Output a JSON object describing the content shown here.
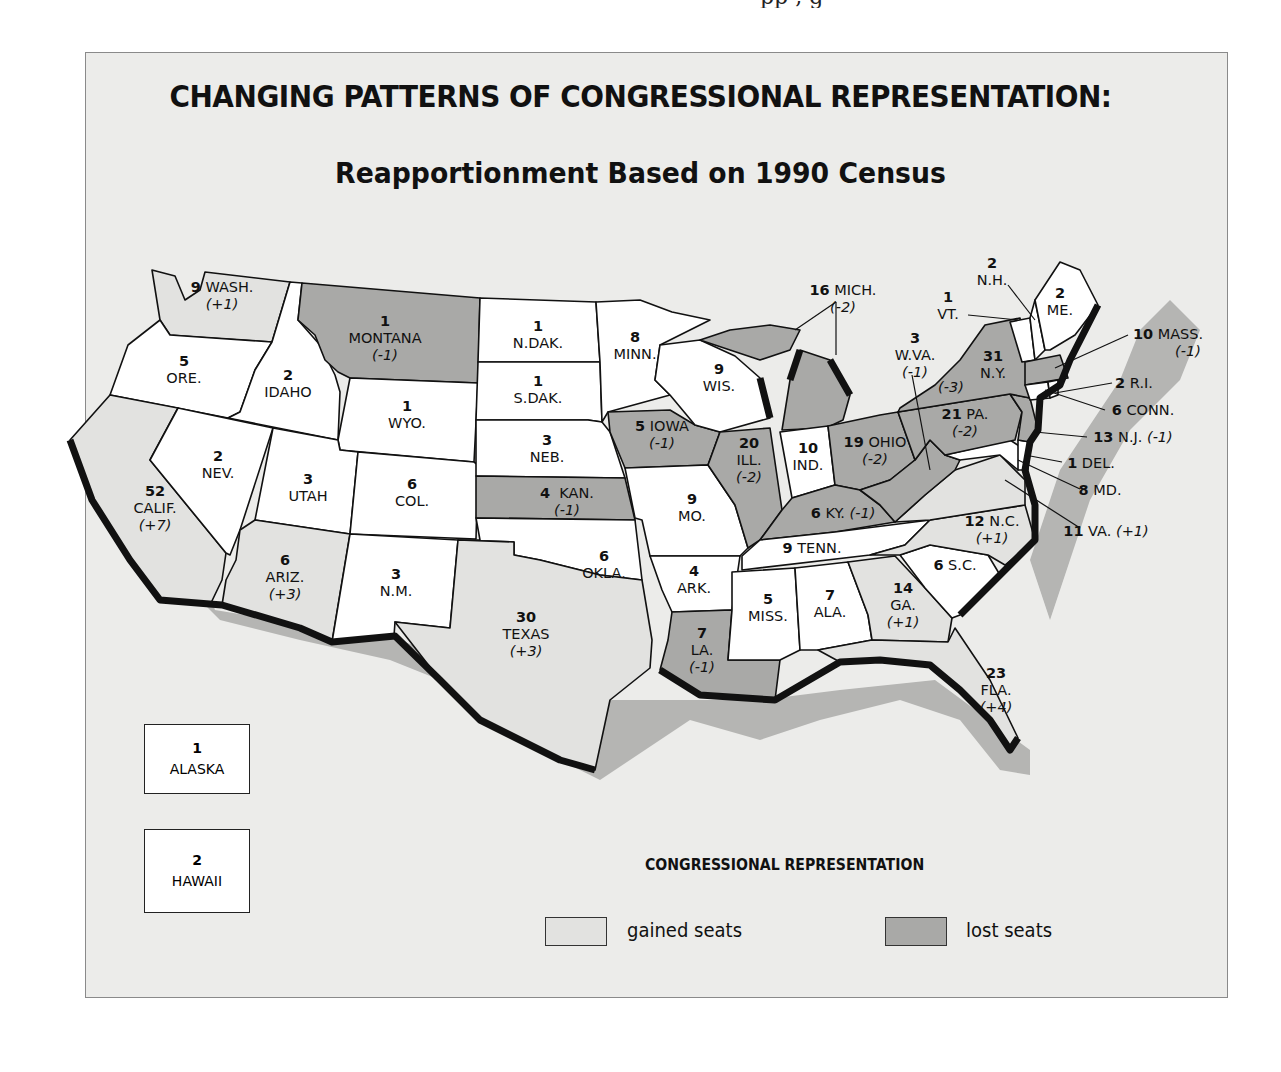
{
  "map": {
    "title": "CHANGING PATTERNS OF CONGRESSIONAL  REPRESENTATION:",
    "subtitle": "Reapportionment Based on 1990 Census",
    "colors": {
      "background": "#ececea",
      "unchanged": "#ffffff",
      "gained": "#e2e2e0",
      "lost": "#a9a9a7",
      "shadow": "#b5b5b3",
      "coast": "#111111"
    },
    "states": [
      {
        "abbr": "WASH.",
        "seats": "9",
        "change": "(+1)",
        "status": "gained"
      },
      {
        "abbr": "ORE.",
        "seats": "5",
        "change": "",
        "status": "unchanged"
      },
      {
        "abbr": "CALIF.",
        "seats": "52",
        "change": "(+7)",
        "status": "gained"
      },
      {
        "abbr": "IDAHO",
        "seats": "2",
        "change": "",
        "status": "unchanged"
      },
      {
        "abbr": "NEV.",
        "seats": "2",
        "change": "",
        "status": "unchanged"
      },
      {
        "abbr": "MONTANA",
        "seats": "1",
        "change": "(-1)",
        "status": "lost"
      },
      {
        "abbr": "WYO.",
        "seats": "1",
        "change": "",
        "status": "unchanged"
      },
      {
        "abbr": "UTAH",
        "seats": "3",
        "change": "",
        "status": "unchanged"
      },
      {
        "abbr": "ARIZ.",
        "seats": "6",
        "change": "(+3)",
        "status": "gained"
      },
      {
        "abbr": "COL.",
        "seats": "6",
        "change": "",
        "status": "unchanged"
      },
      {
        "abbr": "N.M.",
        "seats": "3",
        "change": "",
        "status": "unchanged"
      },
      {
        "abbr": "N.DAK.",
        "seats": "1",
        "change": "",
        "status": "unchanged"
      },
      {
        "abbr": "S.DAK.",
        "seats": "1",
        "change": "",
        "status": "unchanged"
      },
      {
        "abbr": "NEB.",
        "seats": "3",
        "change": "",
        "status": "unchanged"
      },
      {
        "abbr": "KAN.",
        "seats": "4",
        "change": "(-1)",
        "status": "lost"
      },
      {
        "abbr": "OKLA.",
        "seats": "6",
        "change": "",
        "status": "unchanged"
      },
      {
        "abbr": "TEXAS",
        "seats": "30",
        "change": "(+3)",
        "status": "gained"
      },
      {
        "abbr": "MINN.",
        "seats": "8",
        "change": "",
        "status": "unchanged"
      },
      {
        "abbr": "IOWA",
        "seats": "5",
        "change": "(-1)",
        "status": "lost"
      },
      {
        "abbr": "MO.",
        "seats": "9",
        "change": "",
        "status": "unchanged"
      },
      {
        "abbr": "ARK.",
        "seats": "4",
        "change": "",
        "status": "unchanged"
      },
      {
        "abbr": "LA.",
        "seats": "7",
        "change": "(-1)",
        "status": "lost"
      },
      {
        "abbr": "WIS.",
        "seats": "9",
        "change": "",
        "status": "unchanged"
      },
      {
        "abbr": "ILL.",
        "seats": "20",
        "change": "(-2)",
        "status": "lost"
      },
      {
        "abbr": "MICH.",
        "seats": "16",
        "change": "(-2)",
        "status": "lost"
      },
      {
        "abbr": "IND.",
        "seats": "10",
        "change": "",
        "status": "unchanged"
      },
      {
        "abbr": "OHIO",
        "seats": "19",
        "change": "(-2)",
        "status": "lost"
      },
      {
        "abbr": "KY.",
        "seats": "6",
        "change": "(-1)",
        "status": "lost"
      },
      {
        "abbr": "TENN.",
        "seats": "9",
        "change": "",
        "status": "unchanged"
      },
      {
        "abbr": "MISS.",
        "seats": "5",
        "change": "",
        "status": "unchanged"
      },
      {
        "abbr": "ALA.",
        "seats": "7",
        "change": "",
        "status": "unchanged"
      },
      {
        "abbr": "GA.",
        "seats": "14",
        "change": "(+1)",
        "status": "gained"
      },
      {
        "abbr": "FLA.",
        "seats": "23",
        "change": "(+4)",
        "status": "gained"
      },
      {
        "abbr": "S.C.",
        "seats": "6",
        "change": "",
        "status": "unchanged"
      },
      {
        "abbr": "N.C.",
        "seats": "12",
        "change": "(+1)",
        "status": "gained"
      },
      {
        "abbr": "VA.",
        "seats": "11",
        "change": "(+1)",
        "status": "gained"
      },
      {
        "abbr": "W.VA.",
        "seats": "3",
        "change": "(-1)",
        "status": "lost"
      },
      {
        "abbr": "PA.",
        "seats": "21",
        "change": "(-2)",
        "status": "lost"
      },
      {
        "abbr": "N.Y.",
        "seats": "31",
        "change": "(-3)",
        "status": "lost"
      },
      {
        "abbr": "VT.",
        "seats": "1",
        "change": "",
        "status": "unchanged"
      },
      {
        "abbr": "N.H.",
        "seats": "2",
        "change": "",
        "status": "unchanged"
      },
      {
        "abbr": "ME.",
        "seats": "2",
        "change": "",
        "status": "unchanged"
      },
      {
        "abbr": "MASS.",
        "seats": "10",
        "change": "(-1)",
        "status": "lost"
      },
      {
        "abbr": "R.I.",
        "seats": "2",
        "change": "",
        "status": "unchanged"
      },
      {
        "abbr": "CONN.",
        "seats": "6",
        "change": "",
        "status": "unchanged"
      },
      {
        "abbr": "N.J.",
        "seats": "13",
        "change": "(-1)",
        "status": "lost"
      },
      {
        "abbr": "DEL.",
        "seats": "1",
        "change": "",
        "status": "unchanged"
      },
      {
        "abbr": "MD.",
        "seats": "8",
        "change": "",
        "status": "unchanged"
      }
    ],
    "insets": [
      {
        "seats": "1",
        "name": "ALASKA"
      },
      {
        "seats": "2",
        "name": "HAWAII"
      }
    ],
    "legend": {
      "title": "CONGRESSIONAL REPRESENTATION",
      "items": [
        {
          "label": "gained seats",
          "color": "#e2e2e0"
        },
        {
          "label": "lost seats",
          "color": "#a9a9a7"
        }
      ]
    }
  }
}
